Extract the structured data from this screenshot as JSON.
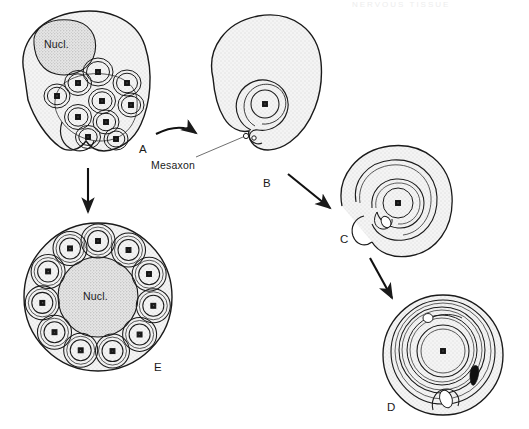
{
  "figure": {
    "type": "biological-schematic",
    "background_color": "#ffffff",
    "ink_color": "#1a1a1a",
    "cytoplasm_fill": "#f2f2f2",
    "nucleus_fill": "#dedede",
    "top_cut_text": "NERVOUS  TISSUE"
  },
  "labels": {
    "nucleus_a": "Nucl.",
    "nucleus_e": "Nucl.",
    "mesaxon": "Mesaxon",
    "stage_a": "A",
    "stage_b": "B",
    "stage_c": "C",
    "stage_d": "D",
    "stage_e": "E"
  },
  "stages": [
    {
      "id": "A",
      "label": "A",
      "caption": "Nucl.",
      "description": "Schwann cell enclosing many small axons in shallow pockets",
      "axon_count": 11,
      "has_nucleus": true,
      "wraps": 0
    },
    {
      "id": "B",
      "label": "B",
      "description": "Single axon engulfed by Schwann cell; mesaxon formed",
      "axon_count": 1,
      "has_nucleus": false,
      "wraps": 1,
      "annotation": "Mesaxon"
    },
    {
      "id": "C",
      "label": "C",
      "description": "Schwann cell membrane begins spiral wrapping around axon",
      "axon_count": 1,
      "has_nucleus": false,
      "wraps": 2
    },
    {
      "id": "D",
      "label": "D",
      "description": "Compact multilamellar myelin sheath around single axon",
      "axon_count": 1,
      "has_nucleus": false,
      "wraps": 5
    },
    {
      "id": "E",
      "label": "E",
      "caption": "Nucl.",
      "description": "Non-myelinating Schwann cell with many axons each in its own pocket",
      "axon_count": 11,
      "has_nucleus": true,
      "wraps": 1
    }
  ],
  "arrows": [
    {
      "from": "A",
      "to": "B",
      "style": "curved"
    },
    {
      "from": "A",
      "to": "E",
      "style": "straight-down"
    },
    {
      "from": "B",
      "to": "C",
      "style": "straight-diagonal"
    },
    {
      "from": "C",
      "to": "D",
      "style": "straight-diagonal"
    }
  ]
}
